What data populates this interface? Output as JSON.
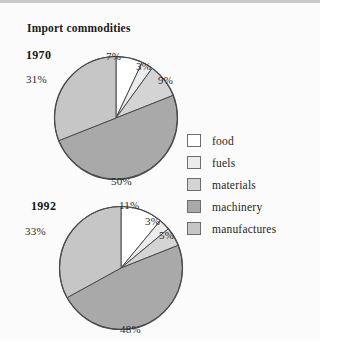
{
  "panel": {
    "title": "Import commodities"
  },
  "legend": {
    "items": [
      {
        "label": "food",
        "color": "#ffffff"
      },
      {
        "label": "fuels",
        "color": "#ececec"
      },
      {
        "label": "materials",
        "color": "#d4d4d4"
      },
      {
        "label": "machinery",
        "color": "#a9a9a9"
      },
      {
        "label": "manufactures",
        "color": "#c6c6c6"
      }
    ]
  },
  "charts": [
    {
      "year": "1970",
      "labels": [
        "7%",
        "3%",
        "9%",
        "50%",
        "31%"
      ]
    },
    {
      "year": "1992",
      "labels": [
        "11%",
        "3%",
        "5%",
        "48%",
        "33%"
      ]
    }
  ],
  "chart_data": {
    "type": "pie",
    "title": "Import commodities",
    "categories": [
      "food",
      "fuels",
      "materials",
      "machinery",
      "manufactures"
    ],
    "colors": [
      "#ffffff",
      "#ececec",
      "#d4d4d4",
      "#a9a9a9",
      "#c6c6c6"
    ],
    "unit": "percent",
    "start_angle_deg": 0,
    "direction": "clockwise",
    "legend_position": "right",
    "grid": false,
    "series": [
      {
        "name": "1970",
        "values": [
          7,
          3,
          9,
          50,
          31
        ],
        "labels": [
          "7%",
          "3%",
          "9%",
          "50%",
          "31%"
        ]
      },
      {
        "name": "1992",
        "values": [
          11,
          3,
          5,
          48,
          33
        ],
        "labels": [
          "11%",
          "3%",
          "5%",
          "48%",
          "33%"
        ]
      }
    ]
  }
}
